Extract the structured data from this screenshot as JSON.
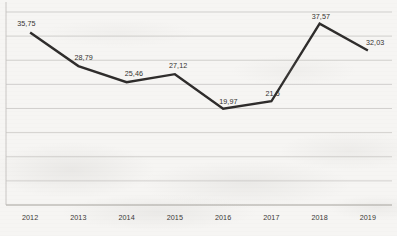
{
  "chart_data": {
    "type": "line",
    "title": "",
    "subtitle": "",
    "xlabel": "",
    "ylabel": "",
    "categories": [
      "2012",
      "2013",
      "2014",
      "2015",
      "2016",
      "2017",
      "2018",
      "2019"
    ],
    "values": [
      35.75,
      28.79,
      25.46,
      27.12,
      19.97,
      21.5,
      37.57,
      32.03
    ],
    "point_labels": [
      "35,75",
      "28,79",
      "25,46",
      "27,12",
      "19,97",
      "21,5",
      "37,57",
      "32,03"
    ],
    "decimal_separator": ",",
    "series": [
      {
        "name": "",
        "values": [
          35.75,
          28.79,
          25.46,
          27.12,
          19.97,
          21.5,
          37.57,
          32.03
        ],
        "color": "#2e2c2b",
        "marker": "none",
        "line_width": 2.4
      }
    ],
    "ylim": [
      0,
      40
    ],
    "xlim_categories": [
      "2012",
      "2019"
    ],
    "gridlines": {
      "horizontal": true,
      "vertical": false,
      "y_values": [
        0,
        5,
        10,
        15,
        20,
        25,
        30,
        35,
        40
      ],
      "color": "#c9c7c4"
    },
    "y_tick_labels_shown": false,
    "legend": {
      "shown": false,
      "position": "none"
    },
    "axis": {
      "left_spine": true,
      "bottom_spine": true,
      "left_spine_color": "#c4c2bf",
      "bottom_spine_color": "#b9b7b4"
    },
    "data_labels_shown": true,
    "background_color": "#f6f5f3",
    "render_note": "scanned-document appearance"
  },
  "axis_labels": {
    "x": [
      "2012",
      "2013",
      "2014",
      "2015",
      "2016",
      "2017",
      "2018",
      "2019"
    ]
  }
}
